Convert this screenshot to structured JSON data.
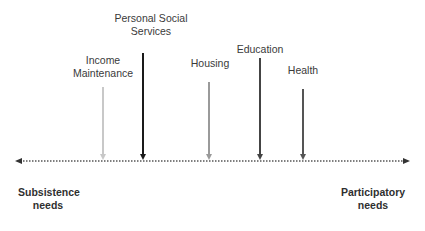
{
  "diagram": {
    "type": "needs-continuum",
    "axis": {
      "style": "dotted double-headed arrow",
      "left_label": "Subsistence needs",
      "right_label": "Participatory needs"
    },
    "labels": {
      "income_maintenance": "Income Maintenance",
      "personal_social_services": "Personal Social Services",
      "housing": "Housing",
      "education": "Education",
      "health": "Health",
      "subsistence": "Subsistence needs",
      "participatory": "Participatory needs"
    },
    "services": [
      {
        "name": "Income Maintenance",
        "x": 103,
        "color": "#c4c4c4"
      },
      {
        "name": "Personal Social Services",
        "x": 143,
        "color": "#1a1a1a"
      },
      {
        "name": "Housing",
        "x": 209,
        "color": "#9a9a9a"
      },
      {
        "name": "Education",
        "x": 260,
        "color": "#444444"
      },
      {
        "name": "Health",
        "x": 303,
        "color": "#555555"
      }
    ]
  }
}
